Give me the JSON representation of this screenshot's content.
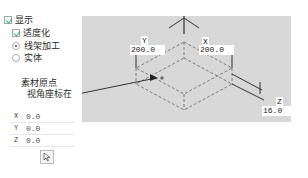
{
  "display": {
    "show_label": "显示",
    "show_checked": true,
    "transparent_label": "适度化",
    "transparent_checked": true,
    "render_modes": [
      {
        "label": "线架加工",
        "selected": true
      },
      {
        "label": "实体",
        "selected": false
      }
    ]
  },
  "origin": {
    "title_line1": "素材原点",
    "title_line2": "视角座标在",
    "coords": [
      {
        "axis": "X",
        "value": "0.0"
      },
      {
        "axis": "Y",
        "value": "0.0"
      },
      {
        "axis": "Z",
        "value": "0.0"
      }
    ],
    "pick_icon": "cursor-arrow-icon"
  },
  "viewport": {
    "dimensions": {
      "y": {
        "label": "Y",
        "value": "200.0"
      },
      "x": {
        "label": "X",
        "value": "200.0"
      },
      "z": {
        "label": "Z",
        "value": "16.0"
      }
    },
    "background": "#d8d8d8",
    "line_color": "#555555"
  }
}
